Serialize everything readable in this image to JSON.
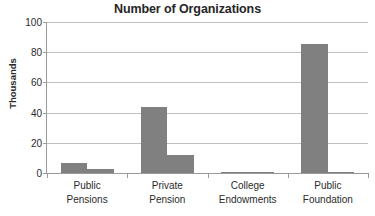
{
  "chart_data": {
    "type": "bar",
    "title": "Number of Organizations",
    "xlabel": "",
    "ylabel": "Thousands",
    "ylim": [
      0,
      100
    ],
    "yticks": [
      0,
      20,
      40,
      60,
      80,
      100
    ],
    "ytick_labels": [
      "0",
      "20",
      "40",
      "60",
      "80",
      "100"
    ],
    "grid": true,
    "legend": "none",
    "categories": [
      "Public Pensions",
      "Private Pension",
      "College Endowments",
      "Public Foundation"
    ],
    "category_lines": [
      [
        "Public",
        "Pensions"
      ],
      [
        "Private",
        "Pension"
      ],
      [
        "College",
        "Endowments"
      ],
      [
        "Public",
        "Foundation"
      ]
    ],
    "series": [
      {
        "name": "Series 1",
        "color": "#808080",
        "values": [
          6.5,
          44.0,
          0.8,
          85.5
        ]
      },
      {
        "name": "Series 2",
        "color": "#808080",
        "values": [
          2.5,
          12.0,
          0.3,
          0.3
        ]
      }
    ]
  },
  "colors": {
    "bar": "#808080",
    "gridline": "#bfbfbf",
    "axis": "#9a9a9a",
    "text": "#2b2b2b",
    "title": "#262626",
    "background": "#ffffff"
  }
}
